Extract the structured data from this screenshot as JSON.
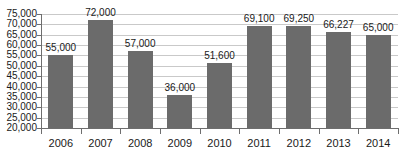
{
  "chart_data": {
    "type": "bar",
    "title": "",
    "subtitle": "",
    "xlabel": "",
    "ylabel": "",
    "categories": [
      "2006",
      "2007",
      "2008",
      "2009",
      "2010",
      "2011",
      "2012",
      "2013",
      "2014"
    ],
    "values": [
      55000,
      72000,
      57000,
      36000,
      51600,
      69100,
      69250,
      66227,
      65000
    ],
    "data_labels": [
      "55,000",
      "72,000",
      "57,000",
      "36,000",
      "51,600",
      "69,100",
      "69,250",
      "66,227",
      "65,000"
    ],
    "ylim": [
      20000,
      75000
    ],
    "ytick_values": [
      20000,
      25000,
      30000,
      35000,
      40000,
      45000,
      50000,
      55000,
      60000,
      65000,
      70000,
      75000
    ],
    "ytick_labels": [
      "20,000",
      "25,000",
      "30,000",
      "35,000",
      "40,000",
      "45,000",
      "50,000",
      "55,000",
      "60,000",
      "65,000",
      "70,000",
      "75,000"
    ],
    "grid": true,
    "legend": false,
    "legend_position": "none",
    "colors": {
      "bar": "#6b6b6b",
      "gridline": "#c9c9c9",
      "axis": "#6e6e6e",
      "text": "#1a1a1a",
      "background": "#ffffff"
    }
  }
}
